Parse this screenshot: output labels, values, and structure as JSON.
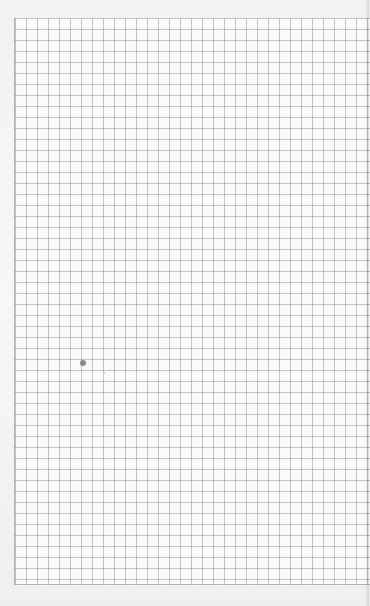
{
  "scene": {
    "description": "Photo of a sheet of square grid (graph) paper",
    "subject": "grid-paper",
    "grid_color": "#96969b",
    "paper_color": "#fbfbfb",
    "background_color": "#ededed",
    "marks": [
      {
        "type": "pencil-dot",
        "color": "#8a8a8e"
      },
      {
        "type": "faint-speck",
        "color": "#c4c4c8"
      }
    ]
  }
}
